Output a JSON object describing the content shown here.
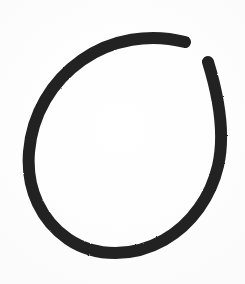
{
  "canvas": {
    "width": 245,
    "height": 284,
    "background_color": "#fefefe",
    "paper_tone": "#fbfbfb"
  },
  "artwork": {
    "title": "Hand-drawn open circle",
    "description": "A single thick hand-drawn open circle (O / C shape) in dark marker ink, with a gap in the upper-right quadrant",
    "medium": "marker",
    "ink_color": "#222222",
    "stroke_width": 12,
    "bounds": {
      "left": 28,
      "right": 222,
      "top": 37,
      "bottom": 253
    },
    "gap": {
      "location": "upper-right",
      "start_point": [
        185,
        42
      ],
      "end_point": [
        208,
        62
      ]
    },
    "strokes": [
      {
        "name": "main-arc",
        "cap_start": "round",
        "cap_end": "round",
        "path": "M 185 42 C 150 33 112 39 82 60 C 52 81 32 114 29 152 C 26 190 42 221 68 239 C 96 258 134 257 164 240 C 192 224 211 196 218 166 C 224 140 221 104 208 62"
      }
    ]
  }
}
